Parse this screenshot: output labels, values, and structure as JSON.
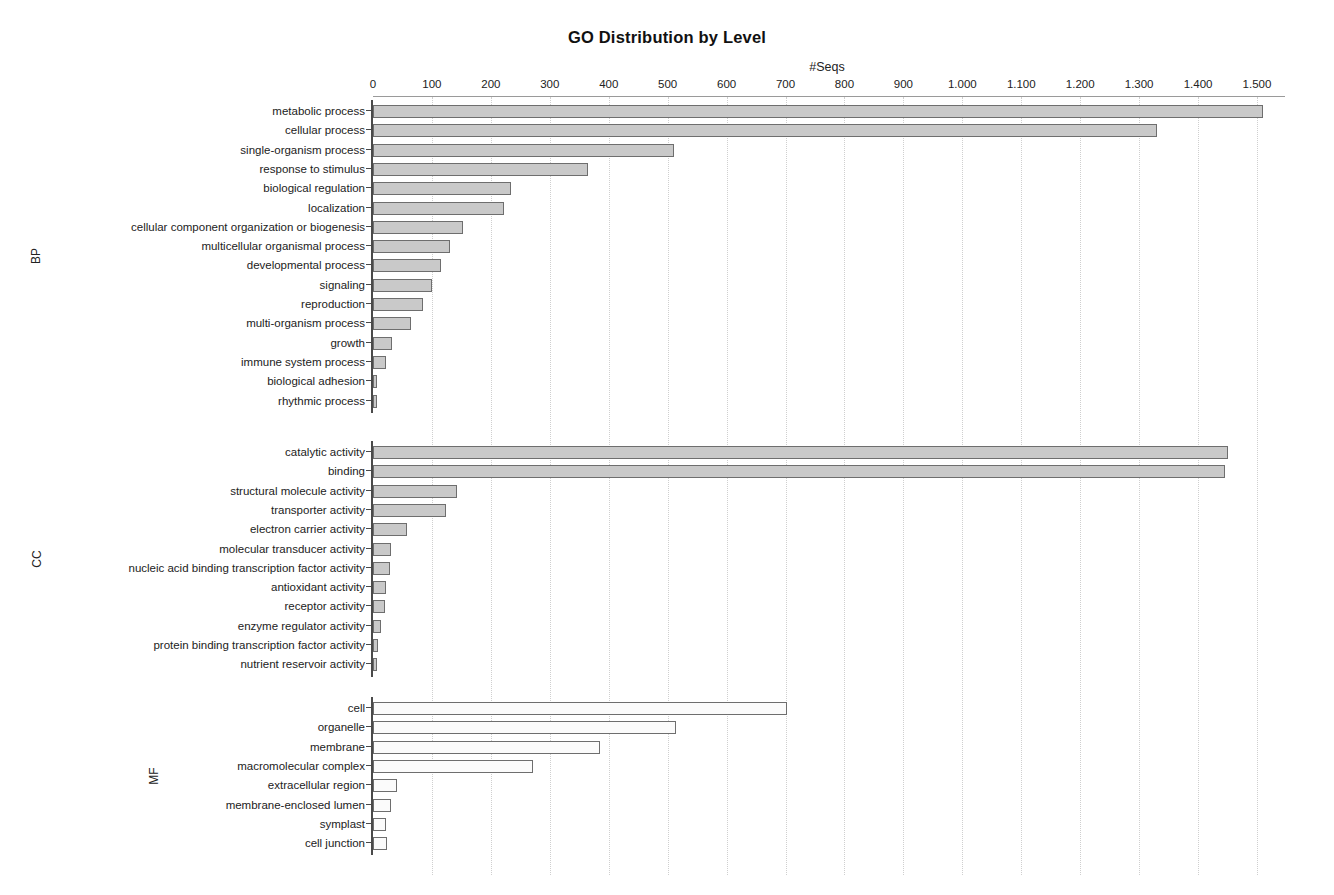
{
  "chart_data": {
    "type": "bar",
    "title": "GO Distribution by Level",
    "orientation": "horizontal",
    "xlabel": "#Seqs",
    "ylabel": "",
    "xlim": [
      0,
      1530
    ],
    "grid": "vertical-dotted",
    "legend": "none",
    "tick_labels": [
      "0",
      "100",
      "200",
      "300",
      "400",
      "500",
      "600",
      "700",
      "800",
      "900",
      "1.000",
      "1.100",
      "1.200",
      "1.300",
      "1.400",
      "1.500"
    ],
    "tick_values": [
      0,
      100,
      200,
      300,
      400,
      500,
      600,
      700,
      800,
      900,
      1000,
      1100,
      1200,
      1300,
      1400,
      1500
    ],
    "panels": [
      {
        "tag": "BP",
        "fill": "filled",
        "categories": [
          "metabolic process",
          "cellular process",
          "single-organism process",
          "response to stimulus",
          "biological regulation",
          "localization",
          "cellular component organization or biogenesis",
          "multicellular organismal process",
          "developmental process",
          "signaling",
          "reproduction",
          "multi-organism process",
          "growth",
          "immune system process",
          "biological adhesion",
          "rhythmic process"
        ],
        "values": [
          1510,
          1330,
          510,
          365,
          235,
          222,
          152,
          130,
          115,
          100,
          85,
          65,
          32,
          22,
          7,
          6
        ]
      },
      {
        "tag": "CC",
        "fill": "filled",
        "categories": [
          "catalytic activity",
          "binding",
          "structural molecule activity",
          "transporter activity",
          "electron carrier activity",
          "molecular transducer activity",
          "nucleic acid binding transcription factor activity",
          "antioxidant activity",
          "receptor activity",
          "enzyme regulator activity",
          "protein binding transcription factor activity",
          "nutrient reservoir activity"
        ],
        "values": [
          1450,
          1445,
          143,
          124,
          58,
          30,
          29,
          22,
          20,
          13,
          9,
          7
        ]
      },
      {
        "tag": "MF",
        "fill": "hollow",
        "categories": [
          "cell",
          "organelle",
          "membrane",
          "macromolecular complex",
          "extracellular region",
          "membrane-enclosed lumen",
          "symplast",
          "cell junction"
        ],
        "values": [
          702,
          514,
          385,
          272,
          40,
          30,
          22,
          23
        ]
      }
    ]
  },
  "colors": {
    "bar_fill": "#c9c9c9",
    "bar_hollow": "#fbfbfb",
    "bar_stroke": "#6e6e6e",
    "grid": "#cfcfcf",
    "axis": "#4a4a4a",
    "text": "#222222",
    "background": "#ffffff"
  }
}
